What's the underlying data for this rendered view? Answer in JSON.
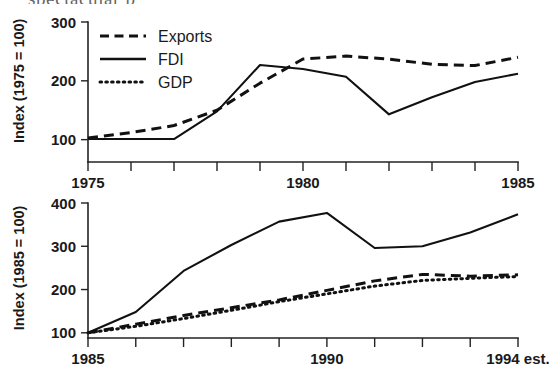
{
  "page": {
    "bleed_text": "spectacular                                        p"
  },
  "legend": {
    "position": "top-left-inside",
    "items": [
      {
        "label": "Exports",
        "style": "dashed"
      },
      {
        "label": "FDI",
        "style": "solid"
      },
      {
        "label": "GDP",
        "style": "dotted"
      }
    ]
  },
  "chart_data": [
    {
      "type": "line",
      "id": "top",
      "title": "",
      "xlabel": "",
      "ylabel": "Index (1975 = 100)",
      "x": [
        1975,
        1976,
        1977,
        1978,
        1979,
        1980,
        1981,
        1982,
        1983,
        1984,
        1985
      ],
      "xtick_labels": [
        "1975",
        "",
        "",
        "",
        "",
        "1980",
        "",
        "",
        "",
        "",
        "1985"
      ],
      "ytick_values": [
        100,
        200,
        300
      ],
      "ytick_labels": [
        "100",
        "200",
        "300"
      ],
      "xlim": [
        1975,
        1985
      ],
      "ylim": [
        62,
        300
      ],
      "grid": false,
      "series": [
        {
          "name": "Exports",
          "style": "dashed",
          "values": [
            103,
            112,
            124,
            150,
            196,
            237,
            242,
            237,
            228,
            226,
            240
          ]
        },
        {
          "name": "FDI",
          "style": "solid",
          "values": [
            101,
            101,
            101,
            148,
            227,
            220,
            207,
            143,
            172,
            198,
            212
          ]
        }
      ]
    },
    {
      "type": "line",
      "id": "bottom",
      "title": "",
      "xlabel": "",
      "ylabel": "Index (1985 = 100)",
      "x": [
        1985,
        1986,
        1987,
        1988,
        1989,
        1990,
        1991,
        1992,
        1993,
        1994
      ],
      "xtick_labels": [
        "1985",
        "",
        "",
        "",
        "",
        "1990",
        "",
        "",
        "",
        "1994 est."
      ],
      "ytick_values": [
        100,
        200,
        300,
        400
      ],
      "ytick_labels": [
        "100",
        "200",
        "300",
        "400"
      ],
      "xlim": [
        1985,
        1994
      ],
      "ylim": [
        88,
        400
      ],
      "grid": false,
      "series": [
        {
          "name": "FDI",
          "style": "solid",
          "values": [
            100,
            148,
            243,
            303,
            357,
            377,
            296,
            300,
            332,
            374
          ]
        },
        {
          "name": "Exports",
          "style": "dashed",
          "values": [
            100,
            120,
            140,
            158,
            176,
            198,
            220,
            235,
            231,
            234
          ]
        },
        {
          "name": "GDP",
          "style": "dotted",
          "values": [
            100,
            115,
            133,
            152,
            172,
            190,
            208,
            221,
            226,
            230
          ]
        }
      ]
    }
  ]
}
